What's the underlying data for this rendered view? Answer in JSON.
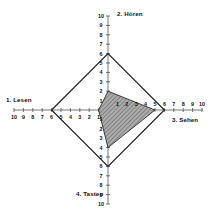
{
  "chart_data": {
    "type": "radar",
    "title": "",
    "axes": [
      {
        "index": 1,
        "label": "1. Lesen",
        "direction": "left",
        "min": 0,
        "max": 10
      },
      {
        "index": 2,
        "label": "2. Hören",
        "direction": "up",
        "min": 0,
        "max": 10
      },
      {
        "index": 3,
        "label": "3. Sehen",
        "direction": "right",
        "min": 0,
        "max": 10
      },
      {
        "index": 4,
        "label": "4. Tasten",
        "direction": "down",
        "min": 0,
        "max": 10
      }
    ],
    "categories": [
      "1. Lesen",
      "2. Hören",
      "3. Sehen",
      "4. Tasten"
    ],
    "tick_values": [
      1,
      2,
      3,
      4,
      5,
      6,
      7,
      8,
      9,
      10
    ],
    "axis_range": [
      0,
      10
    ],
    "grid": false,
    "legend": "none",
    "series": [
      {
        "name": "outer-polygon",
        "values": [
          6,
          6,
          6,
          6
        ],
        "fill": "none",
        "stroke": "#1a1a1a",
        "style": "solid-outline"
      },
      {
        "name": "inner-polygon",
        "values": [
          1,
          2,
          5,
          4
        ],
        "fill": "#9a9a9a",
        "stroke": "#1a1a1a",
        "style": "hatched"
      }
    ],
    "colors": {
      "axis": "#3a3a3a",
      "outline": "#1a1a1a",
      "hatch_fill": "#9a9a9a",
      "background": "#ffffff"
    }
  },
  "geometry": {
    "center_x": 108,
    "center_y": 110,
    "unit_px": 9.4
  }
}
